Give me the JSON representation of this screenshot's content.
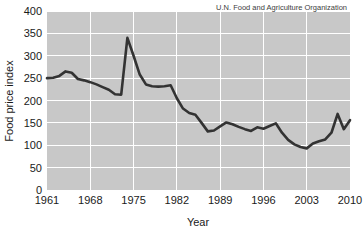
{
  "chart_data": {
    "type": "line",
    "title": "",
    "xlabel": "Year",
    "ylabel": "Food price index",
    "annotation": "U.N. Food and Agriculture Organization",
    "xlim": [
      1961,
      2010
    ],
    "ylim": [
      0,
      400
    ],
    "xticks": [
      1961,
      1968,
      1975,
      1982,
      1989,
      1996,
      2003,
      2010
    ],
    "yticks": [
      0,
      50,
      100,
      150,
      200,
      250,
      300,
      350,
      400
    ],
    "grid": true,
    "legend": "none",
    "series": [
      {
        "name": "Food price index",
        "x": [
          1961,
          1962,
          1963,
          1964,
          1965,
          1966,
          1967,
          1968,
          1969,
          1970,
          1971,
          1972,
          1973,
          1974,
          1975,
          1976,
          1977,
          1978,
          1979,
          1980,
          1981,
          1982,
          1983,
          1984,
          1985,
          1986,
          1987,
          1988,
          1989,
          1990,
          1991,
          1992,
          1993,
          1994,
          1995,
          1996,
          1997,
          1998,
          1999,
          2000,
          2001,
          2002,
          2003,
          2004,
          2005,
          2006,
          2007,
          2008,
          2009,
          2010
        ],
        "values": [
          250,
          251,
          255,
          265,
          262,
          248,
          245,
          241,
          236,
          230,
          224,
          214,
          213,
          340,
          300,
          258,
          236,
          232,
          231,
          232,
          234,
          205,
          182,
          172,
          168,
          150,
          131,
          133,
          142,
          151,
          147,
          141,
          136,
          132,
          140,
          137,
          143,
          149,
          128,
          112,
          102,
          96,
          93,
          104,
          109,
          113,
          128,
          170,
          136,
          156
        ]
      }
    ]
  },
  "axis": {
    "y_tick_labels": [
      "400",
      "350",
      "300",
      "250",
      "200",
      "150",
      "100",
      "50",
      "0"
    ],
    "x_tick_labels": [
      "1961",
      "1968",
      "1975",
      "1982",
      "1989",
      "1996",
      "2003",
      "2010"
    ],
    "y_title": "Food price index",
    "x_title": "Year"
  },
  "annotation": {
    "source": "U.N. Food and Agriculture Organization"
  },
  "colors": {
    "plot_background": "#c8c8c8",
    "gridline": "#ffffff",
    "series_line": "#333333",
    "text": "#1a1a1a",
    "page_background": "#ffffff"
  }
}
